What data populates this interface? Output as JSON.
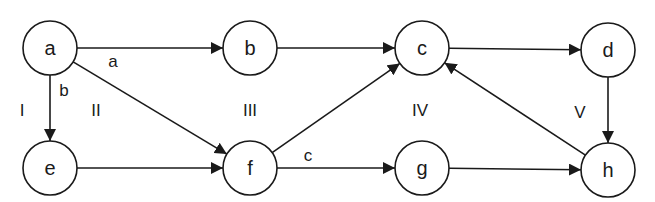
{
  "diagram": {
    "type": "directed-graph",
    "nodes": [
      {
        "id": "a",
        "label": "a"
      },
      {
        "id": "b",
        "label": "b"
      },
      {
        "id": "c",
        "label": "c"
      },
      {
        "id": "d",
        "label": "d"
      },
      {
        "id": "e",
        "label": "e"
      },
      {
        "id": "f",
        "label": "f"
      },
      {
        "id": "g",
        "label": "g"
      },
      {
        "id": "h",
        "label": "h"
      }
    ],
    "edges": [
      {
        "from": "a",
        "to": "b",
        "label": "a"
      },
      {
        "from": "a",
        "to": "e",
        "label": "b"
      },
      {
        "from": "a",
        "to": "f",
        "label": ""
      },
      {
        "from": "b",
        "to": "c",
        "label": ""
      },
      {
        "from": "e",
        "to": "f",
        "label": ""
      },
      {
        "from": "f",
        "to": "c",
        "label": ""
      },
      {
        "from": "f",
        "to": "g",
        "label": "c"
      },
      {
        "from": "c",
        "to": "d",
        "label": ""
      },
      {
        "from": "d",
        "to": "h",
        "label": ""
      },
      {
        "from": "g",
        "to": "h",
        "label": ""
      },
      {
        "from": "h",
        "to": "c",
        "label": ""
      }
    ],
    "regions": [
      {
        "label": "I"
      },
      {
        "label": "II"
      },
      {
        "label": "III"
      },
      {
        "label": "IV"
      },
      {
        "label": "V"
      }
    ]
  }
}
